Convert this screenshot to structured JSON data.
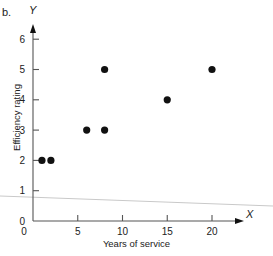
{
  "figure": {
    "panel_letter": "b.",
    "ghost_text": "",
    "y_axis_letter": "Y",
    "x_axis_letter": "X"
  },
  "chart_data": {
    "type": "scatter",
    "title": "",
    "xlabel": "Years of service",
    "ylabel": "Efficiency rating",
    "xlim": [
      0,
      23
    ],
    "ylim": [
      0,
      6.5
    ],
    "grid": false,
    "legend": null,
    "x_ticks": [
      0,
      5,
      10,
      15,
      20
    ],
    "x_tick_labels": [
      "0",
      "5",
      "10",
      "15",
      "20"
    ],
    "y_ticks": [
      0,
      1,
      2,
      3,
      4,
      5,
      6
    ],
    "y_tick_labels": [
      "0",
      "1",
      "2",
      "3",
      "4",
      "5",
      "6"
    ],
    "points": [
      {
        "x": 1,
        "y": 2
      },
      {
        "x": 2,
        "y": 2
      },
      {
        "x": 6,
        "y": 3
      },
      {
        "x": 8,
        "y": 3
      },
      {
        "x": 8,
        "y": 5
      },
      {
        "x": 15,
        "y": 4
      },
      {
        "x": 20,
        "y": 5
      }
    ],
    "marker": {
      "shape": "circle",
      "size": 3.6,
      "color": "#111111"
    },
    "annotations": [
      {
        "name": "scan-artifact-rule",
        "type": "line",
        "color": "#c9c9c9",
        "from": {
          "px": 0,
          "py": 196
        },
        "to": {
          "px": 273,
          "py": 206
        }
      }
    ]
  },
  "colors": {
    "background": "#ffffff",
    "axis": "#555555",
    "marker": "#111111",
    "artifact": "#c9c9c9",
    "text": "#222222"
  }
}
